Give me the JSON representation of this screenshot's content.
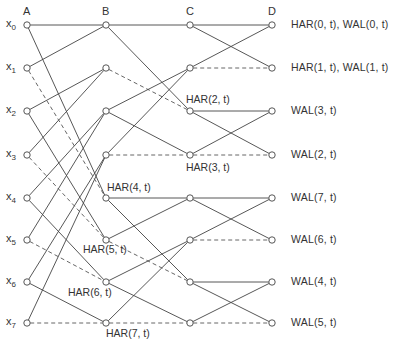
{
  "columns": [
    {
      "label": "A",
      "x": 27
    },
    {
      "label": "B",
      "x": 106
    },
    {
      "label": "C",
      "x": 190
    },
    {
      "label": "D",
      "x": 272
    }
  ],
  "rows_y": [
    25,
    68,
    111,
    155,
    198,
    240,
    282,
    323
  ],
  "inputs": [
    {
      "base": "x",
      "sub": "0"
    },
    {
      "base": "x",
      "sub": "1"
    },
    {
      "base": "x",
      "sub": "2"
    },
    {
      "base": "x",
      "sub": "3"
    },
    {
      "base": "x",
      "sub": "4"
    },
    {
      "base": "x",
      "sub": "5"
    },
    {
      "base": "x",
      "sub": "6"
    },
    {
      "base": "x",
      "sub": "7"
    }
  ],
  "outputs": [
    "HAR(0, t),  WAL(0, t)",
    "HAR(1, t),  WAL(1, t)",
    "WAL(3, t)",
    "WAL(2, t)",
    "WAL(7, t)",
    "WAL(6, t)",
    "WAL(4, t)",
    "WAL(5, t)"
  ],
  "har_labels": [
    {
      "text": "HAR(2, t)",
      "x": 186,
      "y": 93
    },
    {
      "text": "HAR(3, t)",
      "x": 186,
      "y": 161
    },
    {
      "text": "HAR(4, t)",
      "x": 107,
      "y": 181
    },
    {
      "text": "HAR(5, t)",
      "x": 83,
      "y": 243
    },
    {
      "text": "HAR(6, t)",
      "x": 68,
      "y": 286
    },
    {
      "text": "HAR(7, t)",
      "x": 106,
      "y": 327
    }
  ],
  "edges": [
    {
      "from": [
        0,
        0
      ],
      "to": [
        1,
        0
      ],
      "style": "solid"
    },
    {
      "from": [
        0,
        1
      ],
      "to": [
        1,
        0
      ],
      "style": "solid"
    },
    {
      "from": [
        0,
        2
      ],
      "to": [
        1,
        1
      ],
      "style": "solid"
    },
    {
      "from": [
        0,
        3
      ],
      "to": [
        1,
        1
      ],
      "style": "solid"
    },
    {
      "from": [
        0,
        4
      ],
      "to": [
        1,
        2
      ],
      "style": "solid"
    },
    {
      "from": [
        0,
        5
      ],
      "to": [
        1,
        2
      ],
      "style": "solid"
    },
    {
      "from": [
        0,
        6
      ],
      "to": [
        1,
        3
      ],
      "style": "solid"
    },
    {
      "from": [
        0,
        7
      ],
      "to": [
        1,
        3
      ],
      "style": "solid"
    },
    {
      "from": [
        0,
        0
      ],
      "to": [
        1,
        4
      ],
      "style": "solid"
    },
    {
      "from": [
        0,
        1
      ],
      "to": [
        1,
        4
      ],
      "style": "dashed"
    },
    {
      "from": [
        0,
        2
      ],
      "to": [
        1,
        5
      ],
      "style": "solid"
    },
    {
      "from": [
        0,
        3
      ],
      "to": [
        1,
        5
      ],
      "style": "dashed"
    },
    {
      "from": [
        0,
        4
      ],
      "to": [
        1,
        6
      ],
      "style": "solid"
    },
    {
      "from": [
        0,
        5
      ],
      "to": [
        1,
        6
      ],
      "style": "dashed"
    },
    {
      "from": [
        0,
        6
      ],
      "to": [
        1,
        7
      ],
      "style": "solid"
    },
    {
      "from": [
        0,
        7
      ],
      "to": [
        1,
        7
      ],
      "style": "dashed"
    },
    {
      "from": [
        1,
        0
      ],
      "to": [
        2,
        0
      ],
      "style": "solid"
    },
    {
      "from": [
        1,
        0
      ],
      "to": [
        2,
        2
      ],
      "style": "solid"
    },
    {
      "from": [
        1,
        1
      ],
      "to": [
        2,
        2
      ],
      "style": "dashed"
    },
    {
      "from": [
        1,
        2
      ],
      "to": [
        2,
        1
      ],
      "style": "solid"
    },
    {
      "from": [
        1,
        2
      ],
      "to": [
        2,
        3
      ],
      "style": "solid"
    },
    {
      "from": [
        1,
        3
      ],
      "to": [
        2,
        1
      ],
      "style": "solid"
    },
    {
      "from": [
        1,
        3
      ],
      "to": [
        2,
        3
      ],
      "style": "dashed"
    },
    {
      "from": [
        1,
        4
      ],
      "to": [
        2,
        4
      ],
      "style": "solid"
    },
    {
      "from": [
        1,
        4
      ],
      "to": [
        2,
        6
      ],
      "style": "solid"
    },
    {
      "from": [
        1,
        5
      ],
      "to": [
        2,
        4
      ],
      "style": "solid"
    },
    {
      "from": [
        1,
        5
      ],
      "to": [
        2,
        6
      ],
      "style": "dashed"
    },
    {
      "from": [
        1,
        6
      ],
      "to": [
        2,
        5
      ],
      "style": "solid"
    },
    {
      "from": [
        1,
        6
      ],
      "to": [
        2,
        7
      ],
      "style": "solid"
    },
    {
      "from": [
        1,
        7
      ],
      "to": [
        2,
        5
      ],
      "style": "solid"
    },
    {
      "from": [
        1,
        7
      ],
      "to": [
        2,
        7
      ],
      "style": "dashed"
    },
    {
      "from": [
        2,
        0
      ],
      "to": [
        3,
        0
      ],
      "style": "solid"
    },
    {
      "from": [
        2,
        0
      ],
      "to": [
        3,
        1
      ],
      "style": "solid"
    },
    {
      "from": [
        2,
        1
      ],
      "to": [
        3,
        0
      ],
      "style": "solid"
    },
    {
      "from": [
        2,
        1
      ],
      "to": [
        3,
        1
      ],
      "style": "dashed"
    },
    {
      "from": [
        2,
        2
      ],
      "to": [
        3,
        2
      ],
      "style": "solid"
    },
    {
      "from": [
        2,
        2
      ],
      "to": [
        3,
        3
      ],
      "style": "solid"
    },
    {
      "from": [
        2,
        3
      ],
      "to": [
        3,
        2
      ],
      "style": "solid"
    },
    {
      "from": [
        2,
        3
      ],
      "to": [
        3,
        3
      ],
      "style": "dashed"
    },
    {
      "from": [
        2,
        4
      ],
      "to": [
        3,
        4
      ],
      "style": "solid"
    },
    {
      "from": [
        2,
        4
      ],
      "to": [
        3,
        5
      ],
      "style": "solid"
    },
    {
      "from": [
        2,
        5
      ],
      "to": [
        3,
        4
      ],
      "style": "solid"
    },
    {
      "from": [
        2,
        5
      ],
      "to": [
        3,
        5
      ],
      "style": "dashed"
    },
    {
      "from": [
        2,
        6
      ],
      "to": [
        3,
        6
      ],
      "style": "solid"
    },
    {
      "from": [
        2,
        6
      ],
      "to": [
        3,
        7
      ],
      "style": "solid"
    },
    {
      "from": [
        2,
        7
      ],
      "to": [
        3,
        6
      ],
      "style": "solid"
    },
    {
      "from": [
        2,
        7
      ],
      "to": [
        3,
        7
      ],
      "style": "dashed"
    }
  ]
}
